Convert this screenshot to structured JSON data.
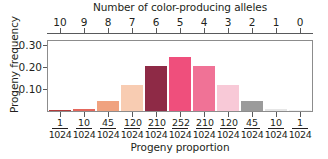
{
  "chart_data": {
    "type": "bar",
    "title": "Number of color-producing alleles",
    "xlabel": "Progeny proportion",
    "ylabel": "Progeny frequency",
    "ylim": [
      0,
      0.32
    ],
    "yticks": [
      "0.10",
      "0.20",
      "0.30"
    ],
    "ytick_values": [
      0.1,
      0.2,
      0.3
    ],
    "grid": false,
    "legend": null,
    "top_axis": {
      "label": "Number of color-producing alleles",
      "ticks": [
        "10",
        "9",
        "8",
        "7",
        "6",
        "5",
        "4",
        "3",
        "2",
        "1",
        "0"
      ]
    },
    "categories": [
      "1/1024",
      "10/1024",
      "45/1024",
      "120/1024",
      "210/1024",
      "252/1024",
      "210/1024",
      "120/1024",
      "45/1024",
      "10/1024",
      "1/1024"
    ],
    "numerators": [
      1,
      10,
      45,
      120,
      210,
      252,
      210,
      120,
      45,
      10,
      1
    ],
    "denominator": 1024,
    "values": [
      0.001,
      0.01,
      0.044,
      0.117,
      0.205,
      0.246,
      0.205,
      0.117,
      0.044,
      0.01,
      0.001
    ],
    "colors": [
      "#b02a2f",
      "#e2685b",
      "#f0a07e",
      "#f7cbb0",
      "#8f2murky",
      "#ee4e7b",
      "#ef7296",
      "#f7c8d6",
      "#9a9a9a",
      "#e0e0e0",
      "#ffffff"
    ],
    "bar_colors": [
      "#b23a3a",
      "#e4675c",
      "#f0a27f",
      "#f8ccb2",
      "#8e2a46",
      "#ef4f7c",
      "#f07296",
      "#f8c9d7",
      "#9b9b9b",
      "#e6e6e6",
      "#ffffff"
    ]
  },
  "axis_colors": {
    "frame": "#8c8c8c",
    "tick": "#58595b",
    "text": "#231f20"
  }
}
